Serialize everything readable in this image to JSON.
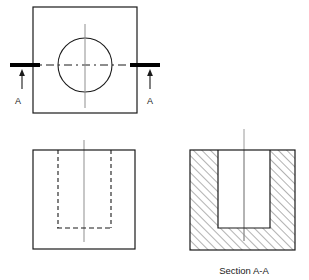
{
  "drawing": {
    "title": "Orthographic drawing with full section",
    "background_color": "#ffffff",
    "line_color": "#1a1a1a",
    "centerline_color": "#9a9a9a",
    "hatch_color": "#555555",
    "cutting_plane_color": "#000000",
    "views": {
      "top": {
        "name": "Top view",
        "outline": {
          "x": 33,
          "y": 7,
          "width": 104,
          "height": 106
        },
        "hole": {
          "cx": 85,
          "cy": 65,
          "r": 27
        },
        "vertical_centerline": {
          "x": 85,
          "y1": 24,
          "y2": 108
        },
        "horizontal_centerline": {
          "y": 65,
          "x1": 10,
          "x2": 160
        },
        "cutting_plane": {
          "label": "A",
          "left_bar": {
            "x1": 10,
            "x2": 40,
            "y": 65,
            "thickness": 4
          },
          "right_bar": {
            "x1": 130,
            "x2": 160,
            "y": 65,
            "thickness": 4
          },
          "left_arrow": {
            "x": 22,
            "y_tail": 88,
            "y_head": 71
          },
          "right_arrow": {
            "x": 150,
            "y_tail": 88,
            "y_head": 71
          },
          "left_label_pos": {
            "x": 18,
            "y": 104
          },
          "right_label_pos": {
            "x": 146,
            "y": 104
          }
        }
      },
      "front": {
        "name": "Front view with hidden lines",
        "outline": {
          "x": 33,
          "y": 150,
          "width": 102,
          "height": 99
        },
        "hidden_left": {
          "x": 58,
          "y1": 150,
          "y2": 228
        },
        "hidden_right": {
          "x": 111,
          "y1": 150,
          "y2": 228
        },
        "hidden_bottom": {
          "y": 228,
          "x1": 58,
          "x2": 111
        },
        "centerline": {
          "x": 84,
          "y1": 140,
          "y2": 242
        }
      },
      "section": {
        "name": "Section A-A view",
        "caption": "Section A-A",
        "caption_pos": {
          "x": 244,
          "y": 274
        },
        "outline": {
          "x": 190,
          "y": 150,
          "width": 105,
          "height": 100
        },
        "cavity": {
          "x": 218,
          "y": 150,
          "width": 52,
          "height": 78
        },
        "centerline": {
          "x": 244,
          "y1": 129,
          "y2": 241
        },
        "hatch": {
          "angle_deg": 45,
          "spacing": 6,
          "stroke_width": 0.9
        }
      }
    },
    "labels": {
      "section_marker": "A",
      "section_caption": "Section A-A"
    }
  }
}
